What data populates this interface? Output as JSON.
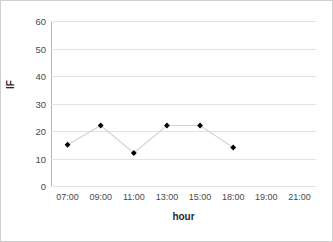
{
  "chart_data": {
    "type": "line",
    "title": "",
    "xlabel": "hour",
    "ylabel": "IF",
    "categories": [
      "07:00",
      "09:00",
      "11:00",
      "13:00",
      "15:00",
      "18:00",
      "19:00",
      "21:00"
    ],
    "values": [
      15,
      22,
      12,
      22,
      22,
      14,
      null,
      null
    ],
    "series": [
      {
        "name": "IF",
        "points": [
          {
            "x": "07:00",
            "y": 15
          },
          {
            "x": "09:00",
            "y": 22
          },
          {
            "x": "11:00",
            "y": 12
          },
          {
            "x": "13:00",
            "y": 22
          },
          {
            "x": "15:00",
            "y": 22
          },
          {
            "x": "18:00",
            "y": 14
          }
        ]
      }
    ],
    "ylim": [
      0,
      60
    ],
    "yticks": [
      0,
      10,
      20,
      30,
      40,
      50,
      60
    ],
    "ytick_labels": [
      "0",
      "10",
      "20",
      "30",
      "40",
      "50",
      "60"
    ],
    "grid": true,
    "grid_axis": "y",
    "legend": false,
    "marker": "diamond",
    "marker_color": "#000000",
    "line_color": "#d4d4d4",
    "background_color": "#ffffff",
    "border_color": "#cfcfcf",
    "gridline_color": "#e2e2e2",
    "axis_color": "#b6b6b6"
  }
}
